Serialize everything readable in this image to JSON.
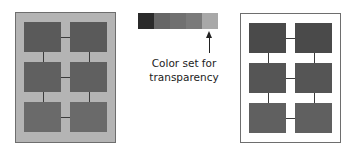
{
  "left_panel": {
    "background": "#b4b4b4",
    "boxes": [
      {
        "color": "#5a5a5a"
      },
      {
        "color": "#5a5a5a"
      },
      {
        "color": "#606060"
      },
      {
        "color": "#606060"
      },
      {
        "color": "#6a6a6a"
      },
      {
        "color": "#6a6a6a"
      }
    ]
  },
  "right_panel": {
    "background": "#ffffff",
    "boxes": [
      {
        "color": "#4a4a4a"
      },
      {
        "color": "#4a4a4a"
      },
      {
        "color": "#555555"
      },
      {
        "color": "#555555"
      },
      {
        "color": "#606060"
      },
      {
        "color": "#606060"
      }
    ]
  },
  "swatch": {
    "colors": [
      "#2a2a2a",
      "#666666",
      "#707070",
      "#7a7a7a",
      "#a8a8a8"
    ],
    "transparent_index": 4
  },
  "annotation": {
    "line1": "Color set for",
    "line2": "transparency"
  }
}
